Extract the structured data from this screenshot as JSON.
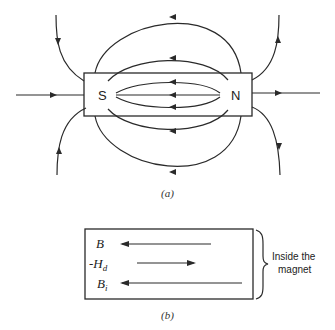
{
  "figure_a": {
    "caption": "(a)",
    "pole_south": "S",
    "pole_north": "N"
  },
  "figure_b": {
    "caption": "(b)",
    "rows": [
      {
        "symbol": "B",
        "subscript": "",
        "prefix": "",
        "direction": "left"
      },
      {
        "symbol": "H",
        "subscript": "d",
        "prefix": "-",
        "direction": "right"
      },
      {
        "symbol": "B",
        "subscript": "i",
        "prefix": "",
        "direction": "left"
      }
    ],
    "brace_label_line1": "Inside the",
    "brace_label_line2": "magnet"
  }
}
